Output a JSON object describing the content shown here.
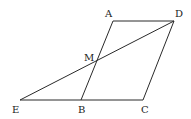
{
  "figure": {
    "type": "geometry",
    "points": [
      {
        "name": "A",
        "x": 113,
        "y": 21,
        "lx": 105,
        "ly": 17
      },
      {
        "name": "D",
        "x": 174,
        "y": 21,
        "lx": 175,
        "ly": 17
      },
      {
        "name": "M",
        "x": 97,
        "y": 61,
        "lx": 84,
        "ly": 61
      },
      {
        "name": "E",
        "x": 20,
        "y": 100,
        "lx": 12,
        "ly": 113
      },
      {
        "name": "B",
        "x": 81,
        "y": 100,
        "lx": 78,
        "ly": 113
      },
      {
        "name": "C",
        "x": 143,
        "y": 100,
        "lx": 141,
        "ly": 113
      }
    ],
    "segments": [
      [
        "A",
        "D"
      ],
      [
        "D",
        "C"
      ],
      [
        "A",
        "B"
      ],
      [
        "E",
        "C"
      ],
      [
        "E",
        "D"
      ]
    ],
    "labels": {
      "A": "A",
      "B": "B",
      "C": "C",
      "D": "D",
      "E": "E",
      "M": "M"
    }
  }
}
